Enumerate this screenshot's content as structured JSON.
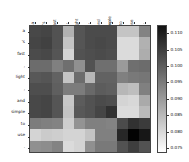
{
  "chart_data": {
    "type": "heatmap",
    "title": "",
    "xlabel": "",
    "ylabel": "",
    "x_tick_labels": [
      "a",
      "'s",
      "fast",
      ",",
      "light",
      ",",
      "and",
      "simple",
      "to",
      "use",
      "."
    ],
    "y_tick_labels": [
      "a",
      "'s",
      "fast",
      ",",
      "light",
      ",",
      "and",
      "simple",
      "to",
      "use",
      "."
    ],
    "colormap": "gray_r",
    "grid": false,
    "legend_position": "right-colorbar",
    "colorbar": {
      "orientation": "vertical",
      "vmin": 0.0735,
      "vmax": 0.1125,
      "tick_values": [
        0.11,
        0.105,
        0.1,
        0.095,
        0.09,
        0.085,
        0.08,
        0.075
      ],
      "tick_labels": [
        "0.110",
        "0.105",
        "0.100",
        "0.095",
        "0.090",
        "0.085",
        "0.080",
        "0.075"
      ],
      "top_color": "#111111",
      "bottom_color": "#ffffff"
    },
    "values": [
      [
        0.1015,
        0.102,
        0.1,
        0.0855,
        0.0995,
        0.101,
        0.101,
        0.101,
        0.0825,
        0.0825,
        0.0925
      ],
      [
        0.102,
        0.1025,
        0.1,
        0.0825,
        0.0995,
        0.101,
        0.1015,
        0.101,
        0.079,
        0.079,
        0.0855
      ],
      [
        0.101,
        0.1015,
        0.0995,
        0.08,
        0.1,
        0.1005,
        0.101,
        0.1005,
        0.079,
        0.079,
        0.086
      ],
      [
        0.096,
        0.096,
        0.093,
        0.0955,
        0.0905,
        0.1,
        0.0955,
        0.0955,
        0.089,
        0.0955,
        0.096
      ],
      [
        0.099,
        0.0995,
        0.0975,
        0.0825,
        0.096,
        0.0845,
        0.0975,
        0.0975,
        0.093,
        0.094,
        0.0945
      ],
      [
        0.1005,
        0.1005,
        0.098,
        0.0935,
        0.0935,
        0.0965,
        0.0985,
        0.098,
        0.0845,
        0.0835,
        0.093
      ],
      [
        0.1015,
        0.102,
        0.0995,
        0.082,
        0.0985,
        0.1,
        0.101,
        0.1005,
        0.08,
        0.0795,
        0.0865
      ],
      [
        0.1015,
        0.102,
        0.0995,
        0.0825,
        0.099,
        0.1,
        0.102,
        0.105,
        0.079,
        0.079,
        0.084
      ],
      [
        0.0935,
        0.093,
        0.0925,
        0.081,
        0.09,
        0.093,
        0.093,
        0.0925,
        0.101,
        0.105,
        0.1035
      ],
      [
        0.08,
        0.0815,
        0.081,
        0.08,
        0.08,
        0.0825,
        0.093,
        0.093,
        0.1065,
        0.112,
        0.109
      ],
      [
        0.0905,
        0.091,
        0.0925,
        0.079,
        0.08,
        0.0905,
        0.094,
        0.094,
        0.1,
        0.103,
        0.1
      ]
    ]
  }
}
